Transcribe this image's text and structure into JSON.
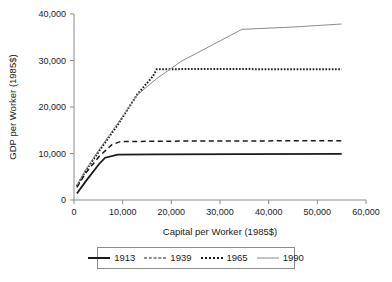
{
  "chart_data": {
    "type": "line",
    "title": "",
    "xlabel": "Capital per Worker (1985$)",
    "ylabel": "GDP per Worker (1985$)",
    "xlim": [
      0,
      60000
    ],
    "ylim": [
      0,
      40000
    ],
    "xticks": [
      0,
      10000,
      20000,
      30000,
      40000,
      50000,
      60000
    ],
    "yticks": [
      0,
      10000,
      20000,
      30000,
      40000
    ],
    "xtick_labels": [
      "0",
      "10,000",
      "20,000",
      "30,000",
      "40,000",
      "50,000",
      "60,000"
    ],
    "ytick_labels": [
      "0",
      "10,000",
      "20,000",
      "30,000",
      "40,000"
    ],
    "grid": false,
    "legend_position": "below",
    "series": [
      {
        "name": "1913",
        "style": "solid",
        "color": "#1a1a1a",
        "width": 1.8,
        "x": [
          600,
          2400,
          5200,
          6400,
          9000,
          17000,
          34500,
          55000
        ],
        "y": [
          1400,
          4000,
          7800,
          9100,
          9750,
          9800,
          9850,
          9900
        ]
      },
      {
        "name": "1939",
        "style": "dashed",
        "color": "#1a1a1a",
        "width": 1.5,
        "x": [
          600,
          2400,
          5200,
          7800,
          9500,
          17000,
          34500,
          55000
        ],
        "y": [
          2700,
          5800,
          9400,
          11900,
          12550,
          12650,
          12700,
          12750
        ]
      },
      {
        "name": "1965",
        "style": "dotted",
        "color": "#1a1a1a",
        "width": 2.0,
        "x": [
          600,
          2400,
          5200,
          9000,
          13000,
          16200,
          17000,
          22000,
          34500,
          55000
        ],
        "y": [
          3000,
          6300,
          10600,
          16200,
          22700,
          26600,
          28100,
          28150,
          28150,
          28100
        ]
      },
      {
        "name": "1990",
        "style": "solid",
        "color": "#8c8c8c",
        "width": 1.0,
        "x": [
          600,
          2400,
          5200,
          9000,
          13000,
          17000,
          22000,
          34500,
          45000,
          55000
        ],
        "y": [
          3200,
          6500,
          10900,
          16500,
          22600,
          26100,
          29800,
          36700,
          37200,
          37850
        ]
      }
    ],
    "legend": [
      {
        "label": "1913",
        "style": "solid-thick",
        "color": "#1a1a1a"
      },
      {
        "label": "1939",
        "style": "dashed",
        "color": "#1a1a1a"
      },
      {
        "label": "1965",
        "style": "dotted",
        "color": "#1a1a1a"
      },
      {
        "label": "1990",
        "style": "solid-thin",
        "color": "#8c8c8c"
      }
    ]
  },
  "axes": {
    "line_color": "#8c8c8c",
    "text_color": "#1a1a1a"
  }
}
